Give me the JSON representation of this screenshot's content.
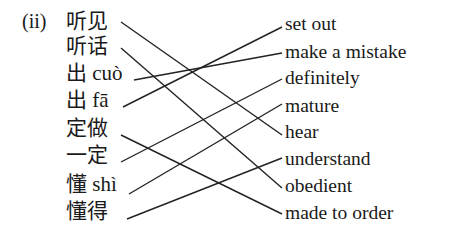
{
  "exercise_label": "(ii)",
  "left_items": [
    {
      "text": "听见"
    },
    {
      "text": "听话"
    },
    {
      "text": "出 cuò"
    },
    {
      "text": "出 fā"
    },
    {
      "text": "定做"
    },
    {
      "text": "一定"
    },
    {
      "text": "懂 shì"
    },
    {
      "text": "懂得"
    }
  ],
  "right_items": [
    {
      "text": "set out"
    },
    {
      "text": "make a mistake"
    },
    {
      "text": "definitely"
    },
    {
      "text": "mature"
    },
    {
      "text": "hear"
    },
    {
      "text": "understand"
    },
    {
      "text": "obedient"
    },
    {
      "text": "made to order"
    }
  ],
  "matches": [
    {
      "left": "听见",
      "right": "hear"
    },
    {
      "left": "听话",
      "right": "obedient"
    },
    {
      "left": "出 cuò",
      "right": "make a mistake"
    },
    {
      "left": "出 fā",
      "right": "set out"
    },
    {
      "left": "定做",
      "right": "made to order"
    },
    {
      "left": "一定",
      "right": "definitely"
    },
    {
      "left": "懂 shì",
      "right": "mature"
    },
    {
      "left": "懂得",
      "right": "understand"
    }
  ]
}
